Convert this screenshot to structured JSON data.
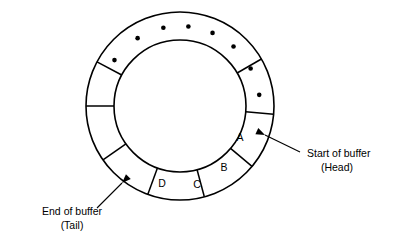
{
  "diagram": {
    "title": "Circular buffer ring diagram",
    "type": "ring-buffer",
    "geometry": {
      "center_x": 180,
      "center_y": 106,
      "outer_radius": 94,
      "inner_radius": 66
    },
    "colors": {
      "stroke": "#000000",
      "fill": "#ffffff",
      "background": "#ffffff"
    },
    "segments": [
      {
        "id": "seg-a",
        "label": "A",
        "start_deg": -30,
        "end_deg": 5,
        "label_x": 240,
        "label_y": 138
      },
      {
        "id": "seg-b",
        "label": "B",
        "start_deg": 5,
        "end_deg": 40,
        "label_x": 224,
        "label_y": 168
      },
      {
        "id": "seg-c",
        "label": "C",
        "start_deg": 40,
        "end_deg": 75,
        "label_x": 197,
        "label_y": 185
      },
      {
        "id": "seg-d",
        "label": "D",
        "start_deg": 75,
        "end_deg": 110,
        "label_x": 162,
        "label_y": 184
      },
      {
        "id": "seg-e",
        "label": "",
        "start_deg": 110,
        "end_deg": 145,
        "label_x": 133,
        "label_y": 166
      },
      {
        "id": "seg-f",
        "label": "",
        "start_deg": 145,
        "end_deg": 180,
        "label_x": 114,
        "label_y": 136
      },
      {
        "id": "seg-g",
        "label": "",
        "start_deg": 180,
        "end_deg": 208,
        "label_x": 110,
        "label_y": 104
      }
    ],
    "ellipsis_dots": [
      {
        "angle_deg": 215
      },
      {
        "angle_deg": 238
      },
      {
        "angle_deg": 258
      },
      {
        "angle_deg": 276
      },
      {
        "angle_deg": 294
      },
      {
        "angle_deg": 312
      },
      {
        "angle_deg": 332
      },
      {
        "angle_deg": 352
      }
    ],
    "annotations": [
      {
        "id": "head-annotation",
        "line1": "Start of buffer",
        "line2": "(Head)",
        "text_x": 307,
        "text_y1": 157,
        "text_y2": 171,
        "align": "start",
        "leader": {
          "x1": 300,
          "y1": 152,
          "x2": 265,
          "y2": 135
        },
        "arrow_angle_deg": 205
      },
      {
        "id": "tail-annotation",
        "line1": "End of buffer",
        "line2": "(Tail)",
        "text_x": 72,
        "text_y1": 215,
        "text_y2": 229,
        "align": "middle",
        "leader": {
          "x1": 97,
          "y1": 208,
          "x2": 122,
          "y2": 183
        },
        "arrow_angle_deg": 315
      }
    ]
  }
}
